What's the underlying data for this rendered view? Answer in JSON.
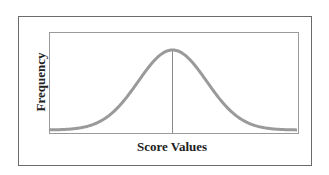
{
  "chart_data": {
    "type": "line",
    "title": "",
    "xlabel": "Score Values",
    "ylabel": "Frequency",
    "x": [
      -3,
      -2.5,
      -2,
      -1.5,
      -1,
      -0.5,
      0,
      0.5,
      1,
      1.5,
      2,
      2.5,
      3
    ],
    "series": [
      {
        "name": "Normal curve",
        "values": [
          0.004,
          0.018,
          0.054,
          0.13,
          0.242,
          0.352,
          0.399,
          0.352,
          0.242,
          0.13,
          0.054,
          0.018,
          0.004
        ]
      }
    ],
    "annotations": [
      {
        "type": "vertical-line",
        "x": 0,
        "label": "mean"
      }
    ],
    "grid": false,
    "ticks": false,
    "colors": {
      "curve": "#9a9a9a",
      "axis": "#8a8a8a",
      "frame": "#6a6a6a"
    }
  },
  "labels": {
    "x": "Score Values",
    "y": "Frequency"
  }
}
